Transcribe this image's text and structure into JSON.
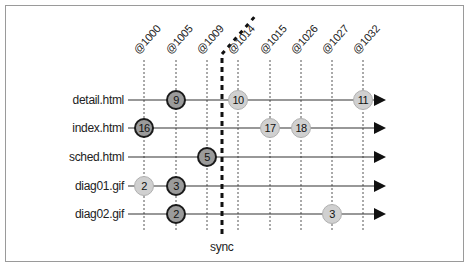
{
  "diagram": {
    "columns": [
      "@1000",
      "@1005",
      "@1009",
      "@1014",
      "@1015",
      "@1026",
      "@1027",
      "@1032"
    ],
    "rows": [
      {
        "label": "detail.html",
        "nodes": [
          {
            "col": 1,
            "value": "9",
            "style": "dark"
          },
          {
            "col": 3,
            "value": "10",
            "style": "light"
          },
          {
            "col": 7,
            "value": "11",
            "style": "light"
          }
        ]
      },
      {
        "label": "index.html",
        "nodes": [
          {
            "col": 0,
            "value": "16",
            "style": "dark"
          },
          {
            "col": 4,
            "value": "17",
            "style": "light"
          },
          {
            "col": 5,
            "value": "18",
            "style": "light"
          }
        ]
      },
      {
        "label": "sched.html",
        "nodes": [
          {
            "col": 2,
            "value": "5",
            "style": "dark"
          }
        ]
      },
      {
        "label": "diag01.gif",
        "nodes": [
          {
            "col": 0,
            "value": "2",
            "style": "light"
          },
          {
            "col": 1,
            "value": "3",
            "style": "dark"
          }
        ]
      },
      {
        "label": "diag02.gif",
        "nodes": [
          {
            "col": 1,
            "value": "2",
            "style": "dark"
          },
          {
            "col": 6,
            "value": "3",
            "style": "light"
          }
        ]
      }
    ],
    "sync_label": "sync",
    "colors": {
      "dark_fill": "#9b9b9b",
      "dark_border": "#1a1a1a",
      "light_fill": "#d0d0d0",
      "light_border": "#b0b0b0",
      "line": "#333333"
    }
  }
}
